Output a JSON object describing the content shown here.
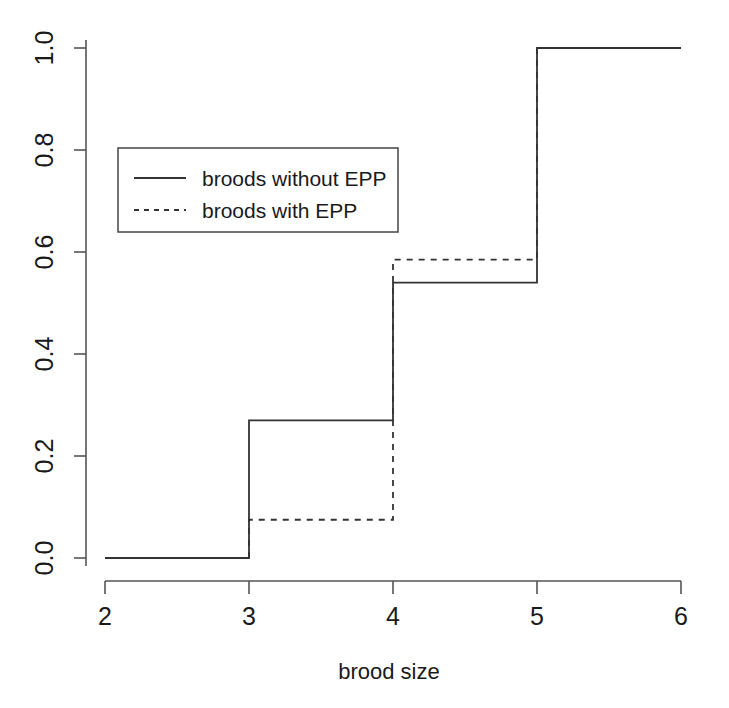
{
  "chart_data": {
    "type": "line",
    "subtype": "step-ecdf",
    "title": "",
    "xlabel": "brood size",
    "ylabel": "",
    "xlim": [
      2,
      6
    ],
    "ylim": [
      0.0,
      1.0
    ],
    "xticks": [
      2,
      3,
      4,
      5,
      6
    ],
    "xticklabels": [
      "2",
      "3",
      "4",
      "5",
      "6"
    ],
    "yticks": [
      0.0,
      0.2,
      0.4,
      0.6,
      0.8,
      1.0
    ],
    "yticklabels": [
      "0.0",
      "0.2",
      "0.4",
      "0.6",
      "0.8",
      "1.0"
    ],
    "grid": false,
    "legend_position": "upper left",
    "step_direction": "post",
    "series": [
      {
        "name": "broods without EPP",
        "linestyle": "solid",
        "color": "#333333",
        "x": [
          2,
          3,
          4,
          5,
          6
        ],
        "values": [
          0.0,
          0.27,
          0.54,
          1.0,
          1.0
        ]
      },
      {
        "name": "broods with EPP",
        "linestyle": "dashed",
        "color": "#333333",
        "x": [
          2,
          3,
          4,
          5,
          6
        ],
        "values": [
          0.0,
          0.075,
          0.585,
          1.0,
          1.0
        ]
      }
    ]
  },
  "axes": {
    "x_title": "brood size",
    "x_tick_labels": [
      "2",
      "3",
      "4",
      "5",
      "6"
    ],
    "y_tick_labels": [
      "0.0",
      "0.2",
      "0.4",
      "0.6",
      "0.8",
      "1.0"
    ]
  },
  "legend": {
    "entries": [
      {
        "label": "broods without EPP",
        "style": "solid"
      },
      {
        "label": "broods with EPP",
        "style": "dashed"
      }
    ]
  },
  "colors": {
    "ink": "#333333",
    "background": "#ffffff"
  }
}
